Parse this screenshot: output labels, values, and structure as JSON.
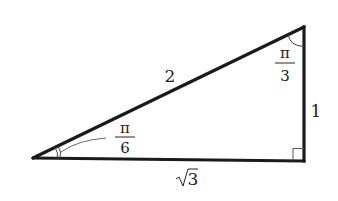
{
  "diagram": {
    "type": "right-triangle",
    "colors": {
      "stroke": "#1a1a1a",
      "text": "#222222",
      "thin": "#555555",
      "background": "#ffffff"
    },
    "vertices": {
      "left": {
        "x": 33,
        "y": 158
      },
      "top_right": {
        "x": 304,
        "y": 27
      },
      "bottom_right": {
        "x": 304,
        "y": 161
      }
    },
    "sides": {
      "hypotenuse": {
        "label": "2"
      },
      "vertical": {
        "label": "1"
      },
      "base": {
        "label": "√3",
        "radicand": "3",
        "radical": "√"
      }
    },
    "angles": {
      "left": {
        "numerator": "π",
        "denominator": "6",
        "label": "π/6"
      },
      "top_right": {
        "numerator": "π",
        "denominator": "3",
        "label": "π/3"
      },
      "bottom_right": {
        "label": "right angle"
      }
    }
  }
}
